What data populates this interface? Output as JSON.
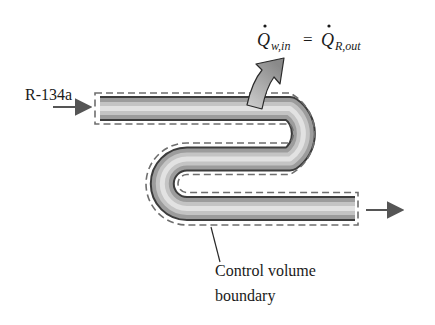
{
  "figure": {
    "inlet_label": "R-134a",
    "equation": {
      "lhs_symbol": "Q",
      "lhs_subscript": "w,in",
      "equals": "=",
      "rhs_symbol": "Q",
      "rhs_subscript": "R,out"
    },
    "boundary_label_line1": "Control volume",
    "boundary_label_line2": "boundary"
  },
  "colors": {
    "tube_dark": "#5a5a5a",
    "tube_light": "#d8d8d8",
    "dashed_boundary": "#6e6e6e",
    "arrow": "#555555",
    "text": "#1a1a1a"
  }
}
